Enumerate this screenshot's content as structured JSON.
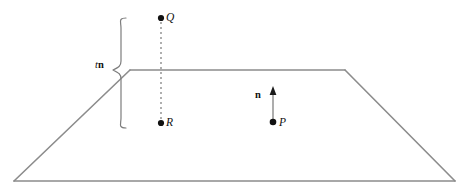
{
  "figure": {
    "type": "geometry-diagram",
    "background_color": "#ffffff",
    "line_color": "#8c8c8c",
    "label_color": "#111111"
  },
  "plane": {
    "name": "plane-quadrilateral",
    "description": "perspective view of a plane drawn as a trapezoid",
    "vertices": [
      {
        "name": "top-left",
        "x": 130,
        "y": 70
      },
      {
        "name": "top-right",
        "x": 345,
        "y": 70
      },
      {
        "name": "bottom-right",
        "x": 455,
        "y": 181
      },
      {
        "name": "bottom-left",
        "x": 14,
        "y": 181
      }
    ]
  },
  "points": [
    {
      "id": "Q",
      "label": "Q",
      "x": 161,
      "y": 18,
      "note": "point above the plane"
    },
    {
      "id": "R",
      "label": "R",
      "x": 161,
      "y": 123,
      "note": "point below the plane"
    },
    {
      "id": "P",
      "label": "P",
      "x": 273,
      "y": 122,
      "note": "point in the plane"
    }
  ],
  "connectors": [
    {
      "name": "QR-dashed-segment",
      "style": "dashed",
      "from": "Q",
      "to": "R",
      "x": 161,
      "y1": 18,
      "y2": 123
    }
  ],
  "vectors": [
    {
      "id": "n",
      "label": "n",
      "bold": true,
      "description": "unit normal vector at P pointing up out of the plane",
      "tail_x": 273,
      "tail_y": 122,
      "head_x": 273,
      "head_y": 88,
      "label_x": 255,
      "label_y": 90
    }
  ],
  "braces": [
    {
      "name": "tn-brace",
      "orientation": "left-facing-vertical",
      "top_y": 18,
      "bottom_y": 128,
      "mid_y": 70,
      "x": 120,
      "label": {
        "scalar": "t",
        "vector": "n"
      },
      "label_x": 95,
      "label_y": 60,
      "meaning": "distance t along the normal n from R up to Q"
    }
  ],
  "labels": {
    "Q": "Q",
    "R": "R",
    "P": "P",
    "n": "n",
    "t_scalar": "t",
    "n_vector": "n"
  }
}
